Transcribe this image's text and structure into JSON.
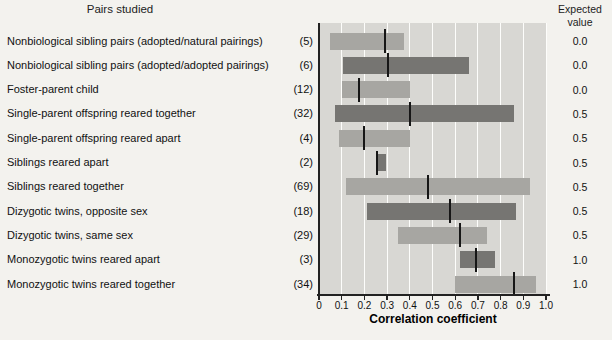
{
  "figure": {
    "pairs_studied_header": "Pairs studied",
    "expected_value_header": "Expected value"
  },
  "chart_data": {
    "type": "bar",
    "subtype": "horizontal-range-bars-with-median",
    "xlabel": "Correlation coefficient",
    "xlim": [
      0,
      1.0
    ],
    "x_tick_labels": [
      "0",
      "0.1",
      "0.2",
      "0.3",
      "0.4",
      "0.5",
      "0.6",
      "0.7",
      "0.8",
      "0.9",
      "1.0"
    ],
    "grid": true,
    "legend_position": "none",
    "columns": {
      "left": "Pairs studied",
      "right": "Expected value"
    },
    "rows": [
      {
        "label": "Nonbiological sibling pairs (adopted/natural pairings)",
        "count": "(5)",
        "min": 0.05,
        "median": 0.29,
        "max": 0.375,
        "expected": "0.0",
        "shade": "light"
      },
      {
        "label": "Nonbiological sibling pairs (adopted/adopted pairings)",
        "count": "(6)",
        "min": 0.105,
        "median": 0.305,
        "max": 0.66,
        "expected": "0.0",
        "shade": "dark"
      },
      {
        "label": "Foster-parent child",
        "count": "(12)",
        "min": 0.1,
        "median": 0.175,
        "max": 0.4,
        "expected": "0.0",
        "shade": "light"
      },
      {
        "label": "Single-parent offspring reared together",
        "count": "(32)",
        "min": 0.07,
        "median": 0.4,
        "max": 0.86,
        "expected": "0.5",
        "shade": "dark"
      },
      {
        "label": "Single-parent offspring reared apart",
        "count": "(4)",
        "min": 0.09,
        "median": 0.2,
        "max": 0.4,
        "expected": "0.5",
        "shade": "light"
      },
      {
        "label": "Siblings reared apart",
        "count": "(2)",
        "min": 0.25,
        "median": 0.255,
        "max": 0.295,
        "expected": "0.5",
        "shade": "dark"
      },
      {
        "label": "Siblings reared together",
        "count": "(69)",
        "min": 0.12,
        "median": 0.48,
        "max": 0.93,
        "expected": "0.5",
        "shade": "light"
      },
      {
        "label": "Dizygotic twins, opposite sex",
        "count": "(18)",
        "min": 0.21,
        "median": 0.575,
        "max": 0.87,
        "expected": "0.5",
        "shade": "dark"
      },
      {
        "label": "Dizygotic twins, same sex",
        "count": "(29)",
        "min": 0.35,
        "median": 0.62,
        "max": 0.74,
        "expected": "0.5",
        "shade": "light"
      },
      {
        "label": "Monozygotic twins reared apart",
        "count": "(3)",
        "min": 0.62,
        "median": 0.69,
        "max": 0.775,
        "expected": "1.0",
        "shade": "dark"
      },
      {
        "label": "Monozygotic twins reared together",
        "count": "(34)",
        "min": 0.6,
        "median": 0.86,
        "max": 0.955,
        "expected": "1.0",
        "shade": "light"
      }
    ],
    "colors": {
      "light_bar": "#a7a6a2",
      "dark_bar": "#767572",
      "plot_bg": "#d8d7d3",
      "gridline": "#fdfdfb",
      "median_line": "#161616",
      "axis": "#222222",
      "page_bg": "#f3f2ee"
    }
  }
}
